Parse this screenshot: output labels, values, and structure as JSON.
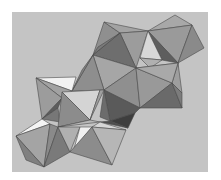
{
  "image": {
    "subject": "polyhedral-structure-render",
    "description": "Grayscale rendering of a chain of linked octahedra",
    "page_background": "#ffffff",
    "panel": {
      "x": 12,
      "y": 12,
      "w": 196,
      "h": 160,
      "color": "#c4c4c4"
    }
  },
  "facets": [
    {
      "pts": "104,22 120,33 93,55",
      "fill": "#8f8f8f"
    },
    {
      "pts": "104,22 148,31 120,33",
      "fill": "#a3a3a3"
    },
    {
      "pts": "120,33 148,31 136,68",
      "fill": "#9c9c9c"
    },
    {
      "pts": "120,33 136,68 93,55",
      "fill": "#6e6e6e"
    },
    {
      "pts": "93,55 120,33 98,47",
      "fill": "#7a7a7a"
    },
    {
      "pts": "148,31 175,15 192,25",
      "fill": "#a8a8a8"
    },
    {
      "pts": "148,31 192,25 178,63",
      "fill": "#9a9a9a"
    },
    {
      "pts": "192,25 204,48 178,63",
      "fill": "#8a8a8a"
    },
    {
      "pts": "148,31 178,63 162,60",
      "fill": "#5e5e5e"
    },
    {
      "pts": "148,31 162,60 140,58",
      "fill": "#d8d8d8"
    },
    {
      "pts": "140,58 162,60 150,68",
      "fill": "#b0b0b0"
    },
    {
      "pts": "136,68 178,63 178,72",
      "fill": "#b4b4b4"
    },
    {
      "pts": "178,63 182,93 172,83",
      "fill": "#9e9e9e"
    },
    {
      "pts": "93,55 136,68 104,90",
      "fill": "#a6a6a6"
    },
    {
      "pts": "93,55 104,90 72,91",
      "fill": "#8e8e8e"
    },
    {
      "pts": "93,55 72,91 82,70",
      "fill": "#858585"
    },
    {
      "pts": "136,68 140,108 104,90",
      "fill": "#8f8f8f"
    },
    {
      "pts": "136,68 172,83 140,108",
      "fill": "#999999"
    },
    {
      "pts": "136,68 178,63 172,83",
      "fill": "#a9a9a9"
    },
    {
      "pts": "172,83 182,108 140,108",
      "fill": "#6a6a6a"
    },
    {
      "pts": "172,83 182,93 182,108",
      "fill": "#7c7c7c"
    },
    {
      "pts": "104,90 140,108 135,113 110,121",
      "fill": "#5a5a5a"
    },
    {
      "pts": "104,90 110,121 100,117",
      "fill": "#6c6c6c"
    },
    {
      "pts": "110,121 135,113 128,128",
      "fill": "#3e3e3e"
    },
    {
      "pts": "100,122 128,128 110,121",
      "fill": "#4e4e4e"
    },
    {
      "pts": "36,78 76,77 72,91",
      "fill": "#f2f2f2"
    },
    {
      "pts": "36,78 72,91 62,98",
      "fill": "#a2a2a2"
    },
    {
      "pts": "36,78 62,98 42,119",
      "fill": "#9c9c9c"
    },
    {
      "pts": "42,119 62,98 58,108",
      "fill": "#5c5c5c"
    },
    {
      "pts": "42,119 58,108 60,122",
      "fill": "#777777"
    },
    {
      "pts": "62,92 100,90 90,120",
      "fill": "#d4d4d4"
    },
    {
      "pts": "62,92 90,120 58,127",
      "fill": "#8c8c8c"
    },
    {
      "pts": "100,90 104,90 90,120",
      "fill": "#a0a0a0"
    },
    {
      "pts": "58,127 90,120 100,122",
      "fill": "#b8b8b8"
    },
    {
      "pts": "16,136 42,119 50,124",
      "fill": "#f4f4f4"
    },
    {
      "pts": "16,136 50,124 44,167",
      "fill": "#a4a4a4"
    },
    {
      "pts": "16,136 44,167 26,160",
      "fill": "#808080"
    },
    {
      "pts": "50,124 58,127 44,167",
      "fill": "#8a8a8a"
    },
    {
      "pts": "44,167 58,127 70,152",
      "fill": "#7a7a7a"
    },
    {
      "pts": "58,127 80,127 70,152",
      "fill": "#b0b0b0"
    },
    {
      "pts": "80,127 92,127 74,149",
      "fill": "#f0f0f0"
    },
    {
      "pts": "70,152 92,127 112,165",
      "fill": "#8c8c8c"
    },
    {
      "pts": "92,127 100,122 126,130",
      "fill": "#d6d6d6"
    },
    {
      "pts": "92,127 126,130 112,165",
      "fill": "#b6b6b6"
    }
  ]
}
